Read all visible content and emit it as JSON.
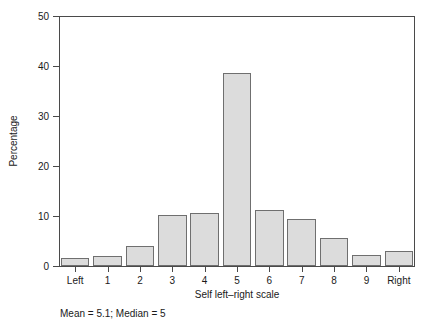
{
  "chart_data": {
    "type": "bar",
    "title": "",
    "subtitle": "",
    "xlabel": "Self left–right scale",
    "ylabel": "Percentage",
    "categories": [
      "Left",
      "1",
      "2",
      "3",
      "4",
      "5",
      "6",
      "7",
      "8",
      "9",
      "Right"
    ],
    "values": [
      1.6,
      2.1,
      4.1,
      10.2,
      10.7,
      38.6,
      11.2,
      9.4,
      5.6,
      2.3,
      3.1
    ],
    "ylim": [
      0,
      50
    ],
    "yticks": [
      0,
      10,
      20,
      30,
      40,
      50
    ],
    "ytick_labels": [
      "0",
      "10",
      "20",
      "30",
      "40",
      "50"
    ],
    "grid": false,
    "legend": false,
    "legend_position": "none",
    "bar_fill_color": "#dcdcdc",
    "bar_border_color": "#6f6f6f",
    "axis_color": "#4a4a4a",
    "text_color": "#1a1a1a",
    "background_color": "#ffffff",
    "annotations": [
      {
        "name": "summary-statistics",
        "text": "Mean = 5.1; Median = 5"
      }
    ]
  },
  "footnote": "Mean = 5.1; Median = 5"
}
